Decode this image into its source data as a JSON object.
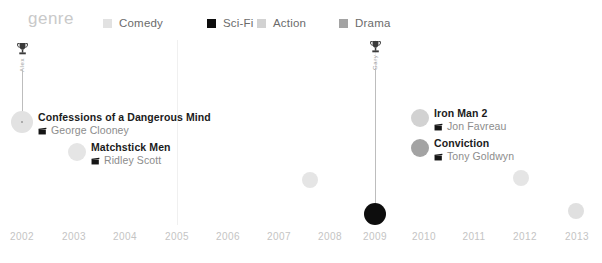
{
  "legend": {
    "title": "genre",
    "items": [
      {
        "label": "Comedy",
        "color": "#e2e2e2",
        "x": 103
      },
      {
        "label": "Sci-Fi",
        "color": "#0d0d0d",
        "x": 207
      },
      {
        "label": "Action",
        "color": "#d2d2d2",
        "x": 257
      },
      {
        "label": "Drama",
        "color": "#a3a3a3",
        "x": 339
      }
    ]
  },
  "axis": {
    "ticks": [
      {
        "label": "2002",
        "x": 22
      },
      {
        "label": "2003",
        "x": 74
      },
      {
        "label": "2004",
        "x": 125
      },
      {
        "label": "2005",
        "x": 177
      },
      {
        "label": "2006",
        "x": 228
      },
      {
        "label": "2007",
        "x": 279
      },
      {
        "label": "2008",
        "x": 330
      },
      {
        "label": "2009",
        "x": 375
      },
      {
        "label": "2010",
        "x": 424
      },
      {
        "label": "2011",
        "x": 474
      },
      {
        "label": "2012",
        "x": 525
      },
      {
        "label": "2013",
        "x": 577
      }
    ],
    "gridlines": [
      177,
      375
    ]
  },
  "markers": [
    {
      "name": "Alex",
      "icon": "trophy-icon",
      "x": 22,
      "icon_top": 2,
      "stem_top": 30,
      "stem_height": 52
    },
    {
      "name": "Gary",
      "icon": "trophy-icon",
      "x": 375,
      "icon_top": 0,
      "stem_top": 28,
      "stem_height": 146
    }
  ],
  "chart_data": {
    "type": "scatter",
    "title": "genre",
    "xlabel": "",
    "ylabel": "",
    "xlim": [
      2002,
      2013
    ],
    "grid": true,
    "legend_position": "top",
    "legend_entries": [
      "Comedy",
      "Sci-Fi",
      "Action",
      "Drama"
    ],
    "genre_colors": {
      "Comedy": "#e2e2e2",
      "Sci-Fi": "#0d0d0d",
      "Action": "#d2d2d2",
      "Drama": "#a3a3a3"
    },
    "points": [
      {
        "title": "Confessions of a Dangerous Mind",
        "director": "George Clooney",
        "year": 2002,
        "genre": "Comedy",
        "color": "#e2e2e2",
        "radius": 11,
        "cx": 22,
        "cy": 82,
        "label_side": "right",
        "has_core": true
      },
      {
        "title": "Matchstick Men",
        "director": "Ridley Scott",
        "year": 2003,
        "genre": "Comedy",
        "color": "#e5e5e5",
        "radius": 9,
        "cx": 77,
        "cy": 112,
        "label_side": "right",
        "has_core": false
      },
      {
        "title": "Choke",
        "director": "Clark Gregg",
        "year": 2008,
        "genre": "Comedy",
        "color": "#e5e5e5",
        "radius": 8,
        "cx": 310,
        "cy": 140,
        "label_side": "left",
        "has_core": false
      },
      {
        "title": "Moon",
        "director": "Duncan Jones",
        "year": 2009,
        "genre": "Sci-Fi",
        "color": "#0d0d0d",
        "radius": 11,
        "cx": 375,
        "cy": 174,
        "label_side": "left",
        "has_core": false
      },
      {
        "title": "Iron Man 2",
        "director": "Jon Favreau",
        "year": 2010,
        "genre": "Action",
        "color": "#d2d2d2",
        "radius": 9,
        "cx": 420,
        "cy": 78,
        "label_side": "right",
        "has_core": false
      },
      {
        "title": "Conviction",
        "director": "Tony Goldwyn",
        "year": 2010,
        "genre": "Drama",
        "color": "#a3a3a3",
        "radius": 9,
        "cx": 420,
        "cy": 108,
        "label_side": "right",
        "has_core": false
      },
      {
        "title": "Seven Psychopaths",
        "director": "Martin McDonagh",
        "year": 2012,
        "genre": "Comedy",
        "color": "#e5e5e5",
        "radius": 8,
        "cx": 521,
        "cy": 138,
        "label_side": "left",
        "has_core": false
      },
      {
        "title": "The Way Way Back",
        "director": "Nat Faxon, Jim Rash",
        "year": 2013,
        "genre": "Comedy",
        "color": "#e0e0e0",
        "radius": 8,
        "cx": 576,
        "cy": 171,
        "label_side": "left",
        "has_core": false
      }
    ]
  }
}
